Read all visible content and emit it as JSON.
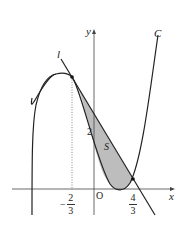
{
  "diagram": {
    "type": "function-graph",
    "axes": {
      "x_label": "x",
      "y_label": "y",
      "origin_label": "O"
    },
    "curve": {
      "label": "C",
      "kind": "cubic"
    },
    "line": {
      "label": "l",
      "kind": "tangent line"
    },
    "region": {
      "label": "S",
      "fill": "#bdbdbd"
    },
    "annotations": {
      "y_intercept": "2",
      "x_left": {
        "sign": "−",
        "num": "2",
        "den": "3"
      },
      "x_right": {
        "num": "4",
        "den": "3"
      }
    },
    "colors": {
      "stroke": "#222222",
      "region_fill": "#bdbdbd",
      "guide": "#555555"
    }
  }
}
